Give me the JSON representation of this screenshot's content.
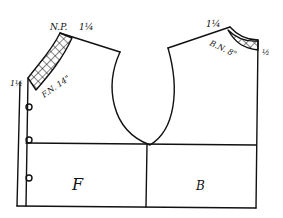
{
  "diagram": {
    "type": "sewing-pattern-bodice-draft",
    "labels": {
      "neck_point": "N.P.",
      "front_shoulder_measure": "1¼",
      "front_neck": "F.N. 14\"",
      "left_side_measure": "1½",
      "back_shoulder_measure": "1¼",
      "back_neck": "B.N. 8\"",
      "back_side_measure": "½",
      "front_panel": "F",
      "back_panel": "B"
    },
    "colors": {
      "ink": "#111111",
      "background": "#ffffff"
    }
  }
}
